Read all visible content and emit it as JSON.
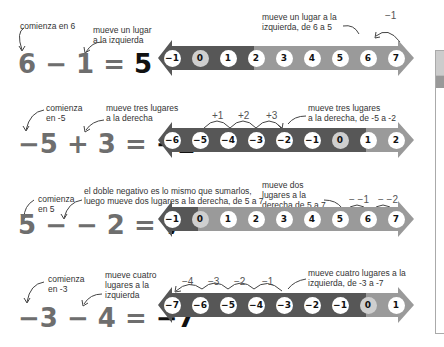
{
  "colors": {
    "negative_segment": "#575757",
    "positive_segment": "#9a9a9a",
    "zero_circle": "#cfcfcf",
    "number_circle": "#ffffff",
    "equation_gray": "#6e6e6e",
    "result_black": "#111111"
  },
  "examples": [
    {
      "equation": {
        "a": "6",
        "op": "−",
        "b": "1",
        "eq": "=",
        "result": "5"
      },
      "note_start": [
        "comienza en 6"
      ],
      "note_move": [
        "mueve un lugar",
        "a la izquierda"
      ],
      "note_line": [
        "mueve un lugar a la",
        "izquierda, de 6 a 5"
      ],
      "numbers": [
        "−1",
        "0",
        "1",
        "2",
        "3",
        "4",
        "5",
        "6",
        "7"
      ],
      "steps": [
        "−1"
      ]
    },
    {
      "equation": {
        "a": "−5",
        "op": "+",
        "b": "3",
        "eq": "=",
        "result": "−2"
      },
      "note_start": [
        "comienza",
        "en -5"
      ],
      "note_move": [
        "mueve tres lugares",
        "a la derecha"
      ],
      "note_line": [
        "mueve tres lugares",
        "a la derecha, de -5 a -2"
      ],
      "numbers": [
        "−6",
        "−5",
        "−4",
        "−3",
        "−2",
        "−1",
        "0",
        "1",
        "2"
      ],
      "steps": [
        "+1",
        "+2",
        "+3"
      ]
    },
    {
      "equation": {
        "a": "5",
        "op": "− −",
        "b": "2",
        "eq": "=",
        "result": "7"
      },
      "note_start": [
        "comienza",
        "en  5"
      ],
      "note_move": [
        "el doble negativo es lo mismo que sumarlos,",
        "luego mueve dos lugares a la derecha, de 5 a 7"
      ],
      "note_line": [
        "mueve dos",
        "lugares a la",
        "derecha de 5 a 7"
      ],
      "numbers": [
        "−1",
        "0",
        "1",
        "2",
        "3",
        "4",
        "5",
        "6",
        "7"
      ],
      "steps": [
        "− −1",
        "− −2"
      ]
    },
    {
      "equation": {
        "a": "−3",
        "op": "−",
        "b": "4",
        "eq": "=",
        "result": "−7"
      },
      "note_start": [
        "comienza",
        "en -3"
      ],
      "note_move": [
        "mueve cuatro",
        "lugares a la",
        "izquierda"
      ],
      "note_line": [
        "mueve cuatro lugares a la",
        "izquierda, de -3 a -7"
      ],
      "numbers": [
        "−7",
        "−6",
        "−5",
        "−4",
        "−3",
        "−2",
        "−1",
        "0",
        "1"
      ],
      "steps": [
        "−4",
        "−3",
        "−2",
        "−1"
      ]
    }
  ]
}
